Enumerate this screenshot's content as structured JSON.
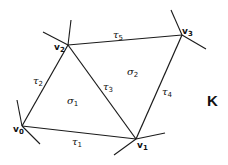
{
  "diagram": {
    "complex_label": "K",
    "vertices": [
      {
        "id": "v0",
        "base": "v",
        "sub": "0",
        "x": 22,
        "y": 126
      },
      {
        "id": "v1",
        "base": "v",
        "sub": "1",
        "x": 136,
        "y": 139
      },
      {
        "id": "v2",
        "base": "v",
        "sub": "2",
        "x": 68,
        "y": 45
      },
      {
        "id": "v3",
        "base": "v",
        "sub": "3",
        "x": 182,
        "y": 35
      }
    ],
    "edges": [
      {
        "id": "tau1",
        "base": "τ",
        "sub": "1",
        "from": "v0",
        "to": "v1"
      },
      {
        "id": "tau2",
        "base": "τ",
        "sub": "2",
        "from": "v0",
        "to": "v2"
      },
      {
        "id": "tau3",
        "base": "τ",
        "sub": "3",
        "from": "v2",
        "to": "v1"
      },
      {
        "id": "tau4",
        "base": "τ",
        "sub": "4",
        "from": "v1",
        "to": "v3"
      },
      {
        "id": "tau5",
        "base": "τ",
        "sub": "5",
        "from": "v2",
        "to": "v3"
      }
    ],
    "faces": [
      {
        "id": "sigma1",
        "base": "σ",
        "sub": "1"
      },
      {
        "id": "sigma2",
        "base": "σ",
        "sub": "2"
      }
    ]
  }
}
